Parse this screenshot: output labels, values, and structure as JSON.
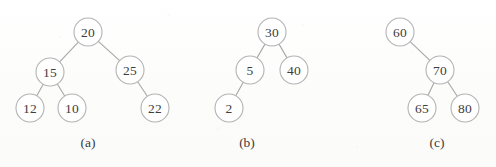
{
  "figure": {
    "background_color": "#fdfdfd",
    "node_fill_color": "#ffffff",
    "node_stroke_color": "#b3b3b3",
    "edge_color": "#a9a9a9",
    "text_color": "#3d3d3d",
    "node_radius": 14
  },
  "trees": [
    {
      "caption": "(a)",
      "caption_x": 88,
      "caption_y": 142,
      "nodes": [
        {
          "label": "20",
          "x": 88,
          "y": 32
        },
        {
          "label": "15",
          "x": 50,
          "y": 72
        },
        {
          "label": "25",
          "x": 130,
          "y": 70
        },
        {
          "label": "12",
          "x": 30,
          "y": 108
        },
        {
          "label": "10",
          "x": 72,
          "y": 108
        },
        {
          "label": "22",
          "x": 155,
          "y": 108
        }
      ],
      "edges": [
        {
          "from": 0,
          "to": 1
        },
        {
          "from": 0,
          "to": 2
        },
        {
          "from": 1,
          "to": 3
        },
        {
          "from": 1,
          "to": 4
        },
        {
          "from": 2,
          "to": 5
        }
      ]
    },
    {
      "caption": "(b)",
      "caption_x": 247,
      "caption_y": 142,
      "nodes": [
        {
          "label": "30",
          "x": 272,
          "y": 32
        },
        {
          "label": "5",
          "x": 250,
          "y": 70
        },
        {
          "label": "40",
          "x": 294,
          "y": 70
        },
        {
          "label": "2",
          "x": 229,
          "y": 108
        }
      ],
      "edges": [
        {
          "from": 0,
          "to": 1
        },
        {
          "from": 0,
          "to": 2
        },
        {
          "from": 1,
          "to": 3
        }
      ]
    },
    {
      "caption": "(c)",
      "caption_x": 437,
      "caption_y": 142,
      "nodes": [
        {
          "label": "60",
          "x": 400,
          "y": 32
        },
        {
          "label": "70",
          "x": 440,
          "y": 70
        },
        {
          "label": "65",
          "x": 422,
          "y": 108
        },
        {
          "label": "80",
          "x": 465,
          "y": 108
        }
      ],
      "edges": [
        {
          "from": 0,
          "to": 1
        },
        {
          "from": 1,
          "to": 2
        },
        {
          "from": 1,
          "to": 3
        }
      ]
    }
  ]
}
